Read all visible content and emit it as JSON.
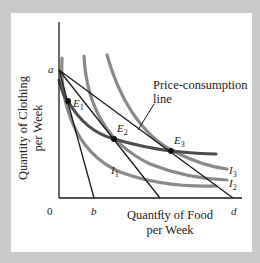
{
  "figure": {
    "y_axis_label_line1": "Quantity of Clothing",
    "y_axis_label_line2": "per Week",
    "x_axis_label_line1": "Quantity of Food",
    "x_axis_label_line2": "per Week",
    "origin_label": "0",
    "y_intercept_label": "a",
    "x_intercepts": [
      "b",
      "c",
      "d"
    ],
    "price_consumption_label_line1": "Price-consumption",
    "price_consumption_label_line2": "line",
    "equilibria": [
      {
        "base": "E",
        "sub": "1"
      },
      {
        "base": "E",
        "sub": "2"
      },
      {
        "base": "E",
        "sub": "3"
      }
    ],
    "indifference_curves": [
      {
        "base": "I",
        "sub": "1"
      },
      {
        "base": "I",
        "sub": "2"
      },
      {
        "base": "I",
        "sub": "3"
      }
    ],
    "colors": {
      "budget_line": "#1a1a1a",
      "indifference_curve": "#808080",
      "price_consumption_line": "#555555",
      "frame_background": "#c9c9c9",
      "panel_background": "#ffffff"
    }
  }
}
